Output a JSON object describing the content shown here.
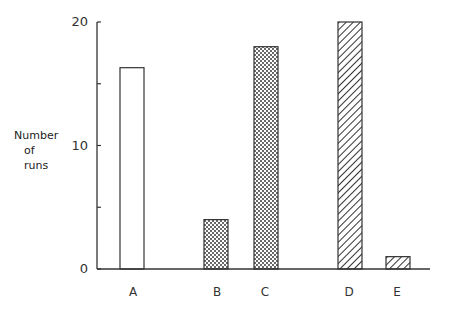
{
  "chart_data": {
    "type": "bar",
    "title": "",
    "xlabel": "",
    "ylabel": "Number of runs",
    "ylabel_lines": [
      "Number",
      "of",
      "runs"
    ],
    "categories": [
      "A",
      "B",
      "C",
      "D",
      "E"
    ],
    "values": [
      16.3,
      4,
      18,
      20,
      1
    ],
    "patterns": [
      "blank",
      "dotted",
      "dotted",
      "hatched",
      "hatched"
    ],
    "ylim": [
      0,
      20
    ],
    "yticks": [
      0,
      10,
      20
    ],
    "yticks_labels": [
      "0",
      "10",
      "20"
    ],
    "minor_yticks": [
      5,
      15
    ],
    "grid": false,
    "legend": null
  }
}
